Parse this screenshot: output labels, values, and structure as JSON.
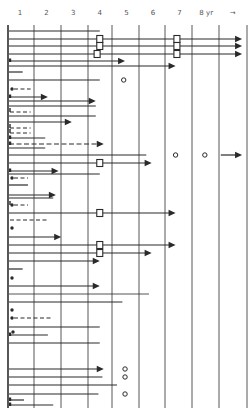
{
  "chart_data": {
    "type": "swimmer",
    "title": "",
    "xlabel": "yr",
    "x_tick_labels": [
      "1",
      "2",
      "3",
      "4",
      "5",
      "6",
      "7",
      "8 yr",
      "→"
    ],
    "xlim": [
      0,
      9
    ],
    "grid": "vertical",
    "legend": [],
    "layout": {
      "x0_px": 8,
      "year_px": 26.6,
      "y_top": 25,
      "y_bottom": 408,
      "grid_x": [
        8,
        34,
        61,
        88,
        112,
        139,
        165,
        192,
        219,
        247
      ]
    },
    "rows": [
      {
        "y": 31,
        "end": 3.45,
        "arrow": false
      },
      {
        "y": 39,
        "end": 8.8,
        "arrow": true,
        "squares": [
          3.45,
          6.35
        ]
      },
      {
        "y": 46,
        "end": 8.8,
        "arrow": true,
        "squares": [
          3.45,
          6.35
        ]
      },
      {
        "y": 54,
        "end": 8.8,
        "arrow": true,
        "squares": [
          3.35,
          6.35
        ]
      },
      {
        "y": 61,
        "end": 4.4,
        "arrow": true,
        "start_tick": true
      },
      {
        "y": 66,
        "end": 6.3,
        "arrow": true
      },
      {
        "y": 72,
        "end": 0.55,
        "arrow": false
      },
      {
        "y": 80,
        "end": 3.45,
        "arrow": false,
        "circles": [
          4.35
        ]
      },
      {
        "y": 89,
        "dashed_end": 0.85,
        "dot_start": true
      },
      {
        "y": 97,
        "end": 1.5,
        "arrow": true,
        "start_tick": true
      },
      {
        "y": 101,
        "end": 3.3,
        "arrow": true
      },
      {
        "y": 106,
        "end": 3.3,
        "arrow": false
      },
      {
        "y": 112,
        "dashed_end": 0.85,
        "start_tick": true
      },
      {
        "y": 116,
        "end": 3.3,
        "arrow": false
      },
      {
        "y": 122,
        "end": 2.4,
        "arrow": true
      },
      {
        "y": 128,
        "dashed_end": 0.85,
        "start_tick": true
      },
      {
        "y": 133,
        "dashed_end": 0.85,
        "start_tick": true
      },
      {
        "y": 138,
        "end": 1.4,
        "arrow": false,
        "start_tick": true
      },
      {
        "y": 144,
        "end": 3.6,
        "arrow": true,
        "dashed": true,
        "start_tick": true
      },
      {
        "y": 148,
        "end": 1.4,
        "arrow": false
      },
      {
        "y": 155,
        "end": 5.2,
        "arrow": false,
        "circles": [
          6.3,
          7.4
        ],
        "far_arrow": [
          8.0,
          8.8
        ]
      },
      {
        "y": 163,
        "end": 5.4,
        "arrow": true,
        "squares": [
          3.45
        ]
      },
      {
        "y": 171,
        "end": 1.9,
        "arrow": true,
        "start_tick": true
      },
      {
        "y": 174,
        "end": 3.45,
        "arrow": false
      },
      {
        "y": 178,
        "dashed_end": 0.75,
        "dot_start": true
      },
      {
        "y": 185,
        "end": 0.75,
        "arrow": false
      },
      {
        "y": 195,
        "end": 1.8,
        "arrow": true
      },
      {
        "y": 198,
        "end": 1.7,
        "arrow": false
      },
      {
        "y": 205,
        "dashed_end": 0.75,
        "dot_start": true,
        "start_tick": true
      },
      {
        "y": 213,
        "end": 6.3,
        "arrow": true,
        "squares": [
          3.45
        ]
      },
      {
        "y": 220,
        "dashed_end": 1.5,
        "dashed_only": true
      },
      {
        "y": 228,
        "dot_only": true
      },
      {
        "y": 237,
        "end": 2.0,
        "arrow": true
      },
      {
        "y": 245,
        "end": 6.3,
        "arrow": true,
        "squares": [
          3.45
        ]
      },
      {
        "y": 253,
        "end": 5.4,
        "arrow": true,
        "squares": [
          3.45
        ]
      },
      {
        "y": 261,
        "end": 3.45,
        "arrow": true
      },
      {
        "y": 269,
        "end": 0.55,
        "arrow": false
      },
      {
        "y": 278,
        "dot_only": true
      },
      {
        "y": 286,
        "end": 3.45,
        "arrow": true
      },
      {
        "y": 294,
        "end": 5.3,
        "arrow": false,
        "thin": true
      },
      {
        "y": 302,
        "end": 4.3,
        "arrow": false
      },
      {
        "y": 310,
        "dot_only": true
      },
      {
        "y": 318,
        "dashed_end": 1.6,
        "dot_start": true
      },
      {
        "y": 327,
        "end": 3.45,
        "arrow": false
      },
      {
        "y": 335,
        "end": 1.5,
        "arrow": false,
        "start_tick": true,
        "dot_start": true
      },
      {
        "y": 343,
        "end": 3.45,
        "arrow": false
      },
      {
        "y": 369,
        "end": 3.6,
        "arrow": true,
        "circles": [
          4.4
        ]
      },
      {
        "y": 377,
        "end": 3.55,
        "arrow": false,
        "circles": [
          4.4
        ]
      },
      {
        "y": 385,
        "end": 4.1,
        "arrow": false
      },
      {
        "y": 394,
        "end": 3.4,
        "arrow": false,
        "circles": [
          4.4
        ]
      },
      {
        "y": 400,
        "end": 0.6,
        "arrow": false,
        "start_tick": true
      },
      {
        "y": 405,
        "end": 1.7,
        "arrow": false,
        "start_tick": true
      }
    ]
  }
}
